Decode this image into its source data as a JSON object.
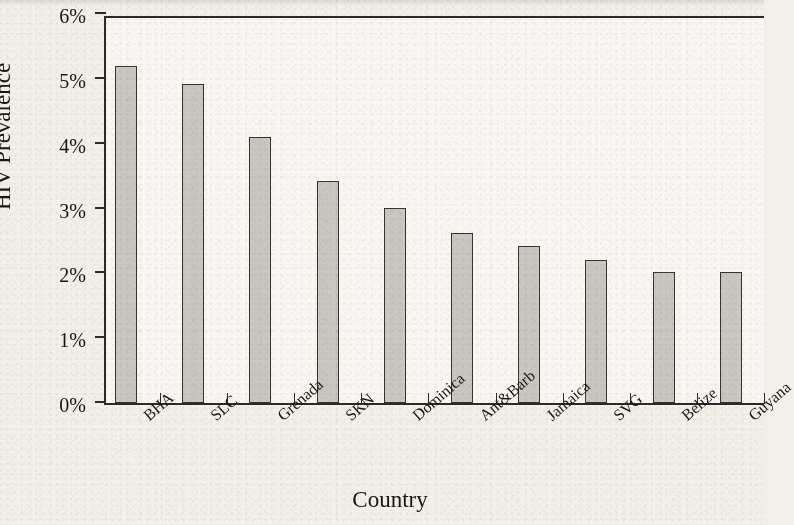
{
  "chart_data": {
    "type": "bar",
    "title": "",
    "xlabel": "Country",
    "ylabel": "HIV Prevalence",
    "categories": [
      "BHA",
      "SLC",
      "Grenada",
      "SKN",
      "Dominica",
      "Ant&Barb",
      "Jamaica",
      "SVG",
      "Belize",
      "Guyana"
    ],
    "values": [
      5.2,
      4.92,
      4.1,
      3.42,
      3.01,
      2.62,
      2.42,
      2.2,
      2.02,
      2.02
    ],
    "value_unit": "%",
    "ylim": [
      0,
      6
    ],
    "ytick_values": [
      0,
      1,
      2,
      3,
      4,
      5,
      6
    ],
    "ytick_labels": [
      "0%",
      "1%",
      "2%",
      "3%",
      "4%",
      "5%",
      "6%"
    ],
    "grid": false,
    "legend": null,
    "bar_color": "#c9c7bf",
    "bar_edge_color": "#35342e",
    "axis_color": "#2b2a26",
    "plot_background": "#f8f7f3",
    "figure_background": "#f1f0ea",
    "xtick_label_rotation": -41
  }
}
